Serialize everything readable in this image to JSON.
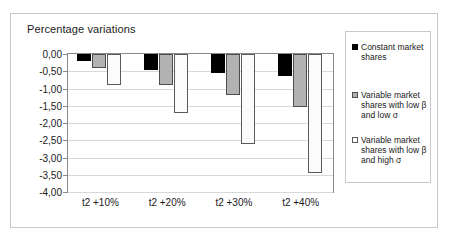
{
  "chart_data": {
    "type": "bar",
    "title": "Percentage variations",
    "xlabel": "",
    "ylabel": "",
    "ylim": [
      -4.0,
      0.0
    ],
    "ytick_labels": [
      "0,00",
      "-0,50",
      "-1,00",
      "-1,50",
      "-2,00",
      "-2,50",
      "-3,00",
      "-3,50",
      "-4,00"
    ],
    "ytick_values": [
      0.0,
      -0.5,
      -1.0,
      -1.5,
      -2.0,
      -2.5,
      -3.0,
      -3.5,
      -4.0
    ],
    "grid": true,
    "legend_position": "right",
    "categories": [
      "t2 +10%",
      "t2 +20%",
      "t2 +30%",
      "t2 +40%"
    ],
    "series": [
      {
        "name": "Constant market shares",
        "color": "#000000",
        "values": [
          -0.2,
          -0.45,
          -0.55,
          -0.65
        ]
      },
      {
        "name": "Variable market shares with low β and low σ",
        "color": "#b2b2b2",
        "values": [
          -0.4,
          -0.9,
          -1.2,
          -1.55
        ]
      },
      {
        "name": "Variable market shares with low β and high σ",
        "color": "#ffffff",
        "values": [
          -0.9,
          -1.7,
          -2.6,
          -3.45
        ]
      }
    ]
  },
  "legend": {
    "items": [
      {
        "label": "Constant market shares",
        "swatch": "black-square-marker"
      },
      {
        "label": "Variable market shares with low β and low σ",
        "swatch": "gray-square-marker"
      },
      {
        "label": "Variable market shares with low β and high σ",
        "swatch": "white-square-marker"
      }
    ]
  }
}
